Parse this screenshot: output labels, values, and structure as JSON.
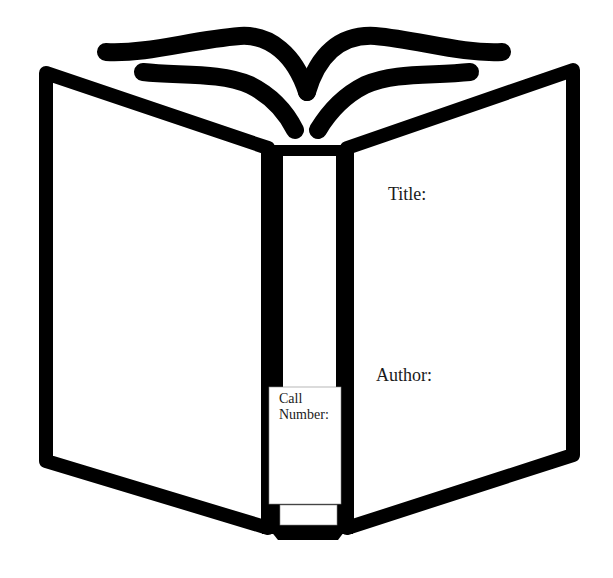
{
  "worksheet": {
    "image": "open-book-outline",
    "fields": {
      "title_label": "Title:",
      "author_label": "Author:",
      "call_number_label_line1": "Call",
      "call_number_label_line2": "Number:"
    }
  },
  "colors": {
    "stroke": "#000000",
    "background": "#ffffff",
    "text": "#1a1a1a"
  }
}
